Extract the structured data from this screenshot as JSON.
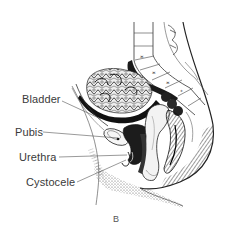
{
  "figure": {
    "caption": "B",
    "labels": [
      {
        "id": "bladder",
        "text": "Bladder",
        "x": 22,
        "y": 94,
        "line": [
          62,
          101,
          101,
          119
        ]
      },
      {
        "id": "pubis",
        "text": "Pubis",
        "x": 15,
        "y": 127,
        "line": [
          43,
          132,
          118,
          138
        ]
      },
      {
        "id": "urethra",
        "text": "Urethra",
        "x": 19,
        "y": 152,
        "line": [
          59,
          157,
          127,
          155
        ]
      },
      {
        "id": "cystocele",
        "text": "Cystocele",
        "x": 26,
        "y": 177,
        "line": [
          77,
          182,
          126,
          160
        ]
      }
    ],
    "colors": {
      "ink": "#1a1a1a",
      "label_text": "#3a3a3a",
      "leader_line": "#555555",
      "background": "#ffffff"
    }
  }
}
